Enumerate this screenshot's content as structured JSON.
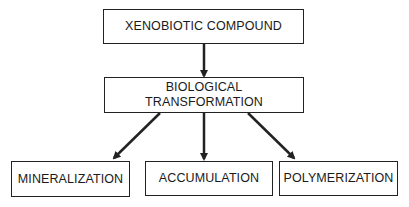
{
  "diagram": {
    "nodes": {
      "source": "XENOBIOTIC COMPOUND",
      "process_line1": "BIOLOGICAL",
      "process_line2": "TRANSFORMATION",
      "outcome_1": "MINERALIZATION",
      "outcome_2": "ACCUMULATION",
      "outcome_3": "POLYMERIZATION"
    },
    "edges": [
      {
        "from": "XENOBIOTIC COMPOUND",
        "to": "BIOLOGICAL TRANSFORMATION"
      },
      {
        "from": "BIOLOGICAL TRANSFORMATION",
        "to": "MINERALIZATION"
      },
      {
        "from": "BIOLOGICAL TRANSFORMATION",
        "to": "ACCUMULATION"
      },
      {
        "from": "BIOLOGICAL TRANSFORMATION",
        "to": "POLYMERIZATION"
      }
    ]
  }
}
